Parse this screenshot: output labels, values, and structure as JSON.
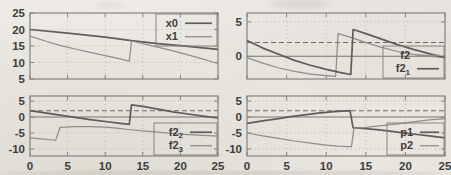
{
  "figure": {
    "background": "#e9e6e0",
    "border_color": "#85837d",
    "grid_color": "#bcb9b2",
    "axis_color": "#76746d",
    "dash_color": "#6e6c65",
    "text_color": "#3e3d38",
    "thick_color": "#5e5d58",
    "thin_color": "#8f8d87"
  },
  "chart_data": [
    {
      "type": "line",
      "position": "top-left",
      "title": "",
      "xlabel": "",
      "ylabel": "",
      "xlim": [
        0,
        25
      ],
      "ylim": [
        5,
        25
      ],
      "xticks": [
        0,
        5,
        10,
        15,
        20,
        25
      ],
      "x_tick_labels": [],
      "yticks": [
        25,
        20,
        15,
        10,
        5
      ],
      "y_tick_labels": [
        "25",
        "20",
        "15",
        "10",
        "5"
      ],
      "v_gridlines": [
        5,
        10,
        15,
        20
      ],
      "h_gridlines": [
        10,
        15,
        20
      ],
      "zero_line": false,
      "dashed_line_y": null,
      "legend": {
        "anchor": "top-right",
        "box": true,
        "width": 61,
        "label_w": 22
      },
      "series": [
        {
          "name": "x0",
          "sub": "",
          "weight": "thick",
          "points": [
            [
              0,
              20
            ],
            [
              5,
              18.9
            ],
            [
              10,
              17.7
            ],
            [
              13.5,
              16.6
            ],
            [
              17,
              15.7
            ],
            [
              21,
              14.9
            ],
            [
              25,
              14.0
            ]
          ]
        },
        {
          "name": "x1",
          "sub": "",
          "weight": "thin",
          "points": [
            [
              0,
              18
            ],
            [
              2,
              16.5
            ],
            [
              4,
              15.2
            ],
            [
              6,
              14.1
            ],
            [
              8,
              13.1
            ],
            [
              10,
              12.1
            ],
            [
              12,
              11.1
            ],
            [
              13.2,
              10.4
            ],
            [
              13.5,
              16.5
            ],
            [
              16,
              15.2
            ],
            [
              19,
              13.5
            ],
            [
              22,
              11.7
            ],
            [
              25,
              9.7
            ]
          ]
        }
      ]
    },
    {
      "type": "line",
      "position": "top-right",
      "title": "",
      "xlabel": "",
      "ylabel": "",
      "xlim": [
        0,
        25
      ],
      "ylim": [
        -3.3,
        6.3
      ],
      "xticks": [
        0,
        5,
        10,
        15,
        20,
        25
      ],
      "x_tick_labels": [],
      "yticks": [
        5,
        0
      ],
      "y_tick_labels": [
        "5",
        "0"
      ],
      "v_gridlines": [
        5,
        10,
        15,
        20
      ],
      "h_gridlines": [
        5
      ],
      "zero_line": true,
      "dashed_line_y": 2,
      "legend": {
        "anchor": "bottom-right",
        "box": true,
        "width": 61,
        "label_w": 27
      },
      "series": [
        {
          "name": "f2",
          "sub": "",
          "weight": "thin",
          "points": [
            [
              0,
              -0.2
            ],
            [
              2,
              -1.0
            ],
            [
              4,
              -1.7
            ],
            [
              6,
              -2.2
            ],
            [
              8,
              -2.6
            ],
            [
              10,
              -2.8
            ],
            [
              11.2,
              -2.9
            ],
            [
              11.5,
              3.3
            ],
            [
              13,
              2.8
            ],
            [
              15,
              2.0
            ],
            [
              17,
              1.3
            ],
            [
              19,
              0.7
            ],
            [
              21,
              0.3
            ],
            [
              23,
              0.0
            ],
            [
              25,
              -0.15
            ]
          ]
        },
        {
          "name": "f2",
          "sub": "1",
          "weight": "thick",
          "points": [
            [
              0,
              2.3
            ],
            [
              2,
              1.2
            ],
            [
              4,
              0.3
            ],
            [
              6,
              -0.6
            ],
            [
              8,
              -1.3
            ],
            [
              10,
              -1.9
            ],
            [
              12,
              -2.4
            ],
            [
              13.1,
              -2.65
            ],
            [
              13.4,
              3.9
            ],
            [
              15,
              3.3
            ],
            [
              17,
              2.5
            ],
            [
              19,
              1.7
            ],
            [
              21,
              1.0
            ],
            [
              23,
              0.4
            ],
            [
              25,
              -0.2
            ]
          ]
        }
      ]
    },
    {
      "type": "line",
      "position": "bottom-left",
      "title": "",
      "xlabel": "",
      "ylabel": "",
      "xlim": [
        0,
        25
      ],
      "ylim": [
        -12.2,
        6.6
      ],
      "xticks": [
        0,
        5,
        10,
        15,
        20,
        25
      ],
      "x_tick_labels": [
        "0",
        "5",
        "10",
        "15",
        "20",
        "25"
      ],
      "yticks": [
        5,
        0,
        -5,
        -10
      ],
      "y_tick_labels": [
        "5",
        "0",
        "-5",
        "-10"
      ],
      "v_gridlines": [
        5,
        10,
        15,
        20
      ],
      "h_gridlines": [
        5,
        -5,
        -10
      ],
      "zero_line": true,
      "dashed_line_y": 2,
      "legend": {
        "anchor": "bottom-right",
        "box": true,
        "width": 63,
        "label_w": 29
      },
      "series": [
        {
          "name": "f2",
          "sub": "2",
          "weight": "thick",
          "points": [
            [
              0,
              2.0
            ],
            [
              2,
              1.3
            ],
            [
              4,
              0.6
            ],
            [
              6,
              -0.1
            ],
            [
              8,
              -0.8
            ],
            [
              10,
              -1.4
            ],
            [
              12,
              -1.95
            ],
            [
              13.2,
              -2.3
            ],
            [
              13.5,
              3.8
            ],
            [
              15,
              3.35
            ],
            [
              17,
              2.5
            ],
            [
              19,
              1.65
            ],
            [
              21,
              0.95
            ],
            [
              23,
              0.3
            ],
            [
              25,
              -0.3
            ]
          ]
        },
        {
          "name": "f2",
          "sub": "3",
          "weight": "thin",
          "points": [
            [
              0,
              -6.5
            ],
            [
              1.5,
              -6.8
            ],
            [
              3,
              -7.2
            ],
            [
              3.4,
              -7.3
            ],
            [
              3.7,
              -5.3
            ],
            [
              4,
              -3.2
            ],
            [
              6,
              -3.0
            ],
            [
              8,
              -3.0
            ],
            [
              10,
              -3.15
            ],
            [
              11.5,
              -3.5
            ],
            [
              13,
              -3.9
            ],
            [
              15,
              -4.35
            ],
            [
              17,
              -4.75
            ],
            [
              19,
              -5.15
            ],
            [
              21,
              -5.5
            ],
            [
              23,
              -5.75
            ],
            [
              25,
              -5.95
            ]
          ]
        }
      ]
    },
    {
      "type": "line",
      "position": "bottom-right",
      "title": "",
      "xlabel": "",
      "ylabel": "",
      "xlim": [
        0,
        25
      ],
      "ylim": [
        -12.2,
        6.6
      ],
      "xticks": [
        0,
        5,
        10,
        15,
        20,
        25
      ],
      "x_tick_labels": [
        "0",
        "5",
        "10",
        "15",
        "20",
        "25"
      ],
      "yticks": [
        5,
        0,
        -5,
        -10
      ],
      "y_tick_labels": [
        "5",
        "0",
        "-5",
        "-10"
      ],
      "v_gridlines": [
        5,
        10,
        15,
        20
      ],
      "h_gridlines": [
        5,
        -5,
        -10
      ],
      "zero_line": true,
      "dashed_line_y": 2,
      "legend": {
        "anchor": "bottom-right",
        "box": true,
        "width": 57,
        "label_w": 26
      },
      "series": [
        {
          "name": "p1",
          "sub": "",
          "weight": "thick",
          "points": [
            [
              0,
              -2.0
            ],
            [
              2,
              -1.2
            ],
            [
              4,
              -0.5
            ],
            [
              5.5,
              0.1
            ],
            [
              7,
              0.6
            ],
            [
              9,
              1.2
            ],
            [
              11,
              1.7
            ],
            [
              12.5,
              1.95
            ],
            [
              13.0,
              2.0
            ],
            [
              13.4,
              -3.3
            ],
            [
              15,
              -3.6
            ],
            [
              17,
              -4.1
            ],
            [
              19,
              -4.7
            ],
            [
              21,
              -5.3
            ],
            [
              23,
              -5.9
            ],
            [
              25,
              -6.5
            ]
          ]
        },
        {
          "name": "p2",
          "sub": "",
          "weight": "thin",
          "points": [
            [
              0,
              -5.0
            ],
            [
              2,
              -5.9
            ],
            [
              4,
              -6.7
            ],
            [
              6,
              -7.5
            ],
            [
              8,
              -8.2
            ],
            [
              10,
              -8.8
            ],
            [
              11.5,
              -9.1
            ],
            [
              12.8,
              -9.3
            ],
            [
              13.2,
              -9.3
            ],
            [
              13.5,
              -3.5
            ],
            [
              15,
              -3.2
            ],
            [
              17,
              -2.7
            ],
            [
              19,
              -2.1
            ],
            [
              21,
              -1.5
            ],
            [
              23,
              -0.9
            ],
            [
              25,
              -0.5
            ]
          ]
        }
      ]
    }
  ]
}
